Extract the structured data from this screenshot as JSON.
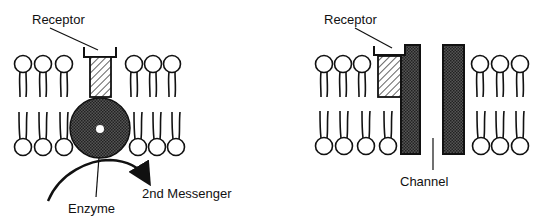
{
  "diagram": {
    "type": "membrane-receptor-mechanisms",
    "left_panel": {
      "receptor_label": "Receptor",
      "enzyme_label": "Enzyme",
      "product_label": "2nd Messenger"
    },
    "right_panel": {
      "receptor_label": "Receptor",
      "channel_label": "Channel"
    },
    "colors": {
      "ink": "#111111",
      "background": "#ffffff",
      "stipple": "#3a3a3a"
    }
  }
}
